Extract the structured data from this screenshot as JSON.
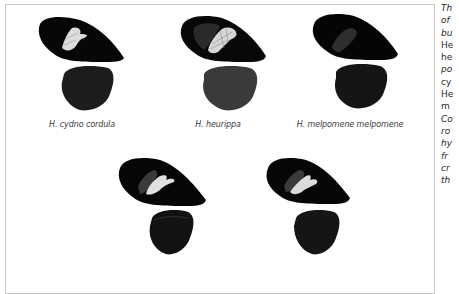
{
  "figure": {
    "specimens": [
      {
        "id": "cydno-cordula",
        "caption": "H. cydno cordula",
        "patch": "white"
      },
      {
        "id": "heurippa",
        "caption": "H. heurippa",
        "patch": "white-veined"
      },
      {
        "id": "melpomene-melpomene",
        "caption": "H. melpomene melpomene",
        "patch": "faint"
      },
      {
        "id": "hybrid-1",
        "caption": "",
        "patch": "white-partial"
      },
      {
        "id": "hybrid-2",
        "caption": "",
        "patch": "white-partial"
      }
    ],
    "colors": {
      "wing_black": "#0a0a0a",
      "hindwing": "#1c1c1c",
      "patch_white": "#d8d8d8",
      "border": "#c9c9c9"
    }
  },
  "side_text": {
    "lines": [
      {
        "text": "Th",
        "italic": true
      },
      {
        "text": "of",
        "italic": true
      },
      {
        "text": "bu",
        "italic": true
      },
      {
        "text": "He",
        "italic": false
      },
      {
        "text": "he",
        "italic": false
      },
      {
        "text": "po",
        "italic": true
      },
      {
        "text": "cy",
        "italic": false
      },
      {
        "text": "He",
        "italic": false
      },
      {
        "text": "m",
        "italic": false
      },
      {
        "text": "Co",
        "italic": true
      },
      {
        "text": "ro",
        "italic": true
      },
      {
        "text": "hy",
        "italic": true
      },
      {
        "text": "fr",
        "italic": true
      },
      {
        "text": "cr",
        "italic": true
      },
      {
        "text": "th",
        "italic": true
      }
    ]
  }
}
